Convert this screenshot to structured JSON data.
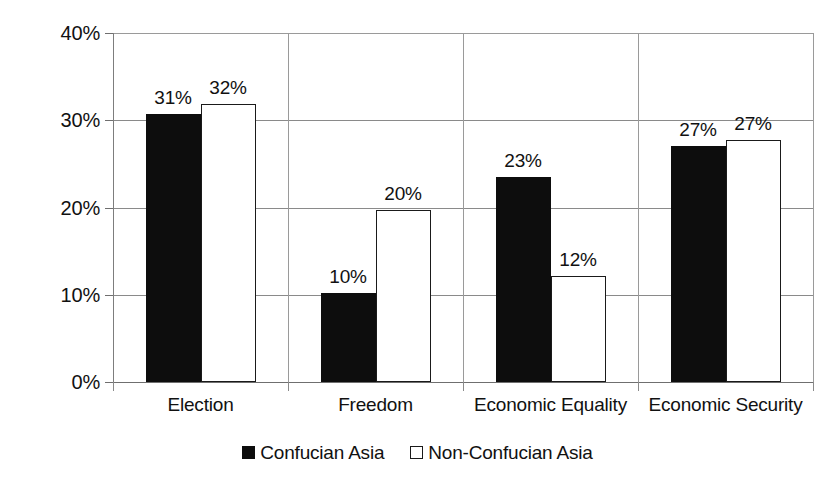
{
  "chart_data": {
    "type": "bar",
    "title": "",
    "subtitle": "",
    "xlabel": "",
    "ylabel": "",
    "ylim": [
      0,
      40
    ],
    "ytick_labels": [
      "0%",
      "10%",
      "20%",
      "30%",
      "40%"
    ],
    "ytick_values": [
      0,
      10,
      20,
      30,
      40
    ],
    "grid": true,
    "legend_position": "bottom",
    "categories": [
      "Election",
      "Freedom",
      "Economic Equality",
      "Economic Security"
    ],
    "series": [
      {
        "name": "Confucian Asia",
        "color": "#0d0d0d",
        "style": "filled",
        "values": [
          31,
          10,
          23,
          27
        ],
        "labels": [
          "31%",
          "10%",
          "23%",
          "27%"
        ],
        "plotted_heights": [
          30.7,
          10.2,
          23.5,
          27.1
        ]
      },
      {
        "name": "Non-Confucian Asia",
        "color": "#ffffff",
        "style": "outlined",
        "values": [
          32,
          20,
          12,
          27
        ],
        "labels": [
          "32%",
          "20%",
          "12%",
          "27%"
        ],
        "plotted_heights": [
          31.9,
          19.7,
          12.2,
          27.7
        ]
      }
    ]
  },
  "legend": {
    "items": [
      {
        "label": "Confucian Asia",
        "swatch": "filled-square-black-icon"
      },
      {
        "label": "Non-Confucian Asia",
        "swatch": "outlined-square-white-icon"
      }
    ]
  }
}
